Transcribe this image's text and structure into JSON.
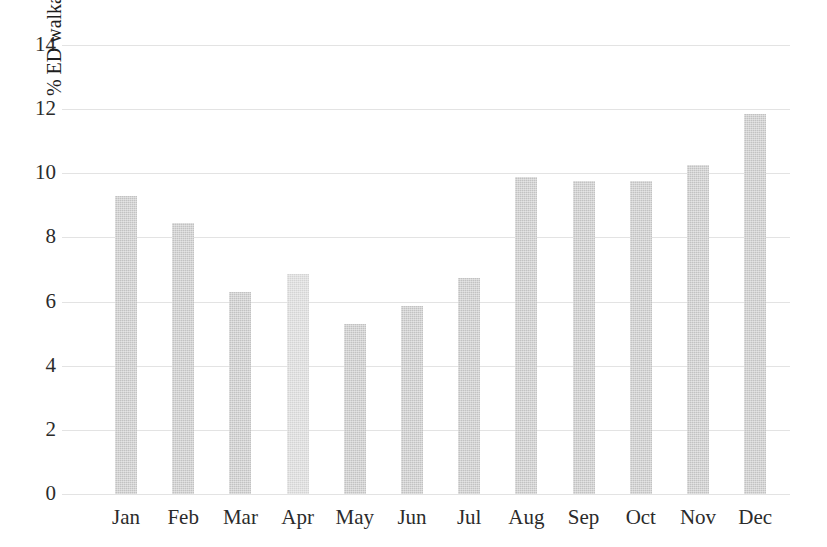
{
  "chart_data": {
    "type": "bar",
    "title": "",
    "subtitle": "",
    "xlabel": "",
    "ylabel": "% ED walkaways",
    "categories": [
      "Jan",
      "Feb",
      "Mar",
      "Apr",
      "May",
      "Jun",
      "Jul",
      "Aug",
      "Sep",
      "Oct",
      "Nov",
      "Dec"
    ],
    "values": [
      9.3,
      8.45,
      6.3,
      6.85,
      5.3,
      5.85,
      6.75,
      9.9,
      9.75,
      9.75,
      10.25,
      11.85
    ],
    "ylim": [
      0,
      14
    ],
    "ytick_labels": [
      "0",
      "2",
      "4",
      "6",
      "8",
      "10",
      "12",
      "14"
    ],
    "ytick_values": [
      0,
      2,
      4,
      6,
      8,
      10,
      12,
      14
    ],
    "grid": true,
    "grid_axis": "y",
    "legend": false,
    "legend_position": "none",
    "bar_color": "#c2c2c2",
    "bar_color_highlight": "#d4d4d4",
    "grid_color": "#e3e3e3",
    "background_color": "#ffffff",
    "text_color": "#2b2b2b",
    "highlight_index": 3
  }
}
